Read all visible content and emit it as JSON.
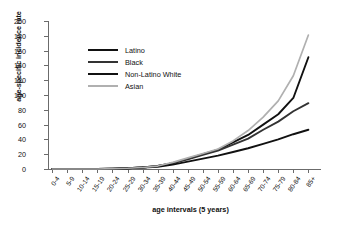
{
  "chart_data": {
    "type": "line",
    "title": "",
    "xlabel": "age intervals (5 years)",
    "ylabel": "age-specific incidence rate",
    "categories": [
      "0-4",
      "5-9",
      "10-14",
      "15-19",
      "20-24",
      "25-29",
      "30-34",
      "35-39",
      "40-44",
      "45-49",
      "50-54",
      "55-59",
      "60-64",
      "65-69",
      "70-74",
      "75-79",
      "80-84",
      "85+"
    ],
    "ylim": [
      0,
      200
    ],
    "yticks": [
      0,
      20,
      40,
      60,
      80,
      100,
      120,
      140,
      160,
      180,
      200
    ],
    "grid": false,
    "legend_position": "upper-left-inside",
    "series": [
      {
        "name": "Latino",
        "color": "#111111",
        "width": 1.9,
        "values": [
          0,
          0,
          0,
          0,
          0.5,
          1,
          2,
          4,
          8,
          14,
          20,
          26,
          36,
          46,
          60,
          74,
          96,
          151
        ]
      },
      {
        "name": "Black",
        "color": "#333333",
        "width": 1.9,
        "values": [
          0,
          0,
          0,
          0,
          0.5,
          1,
          2,
          4,
          8,
          13,
          19,
          25,
          33,
          41,
          53,
          64,
          78,
          89
        ]
      },
      {
        "name": "Non-Latino White",
        "color": "#111111",
        "width": 1.9,
        "values": [
          0,
          0,
          0,
          0,
          0.5,
          1,
          2,
          3,
          6,
          10,
          14,
          18,
          23,
          28,
          34,
          40,
          47,
          53
        ]
      },
      {
        "name": "Asian",
        "color": "#b0b0b0",
        "width": 1.7,
        "values": [
          0,
          0,
          0,
          0,
          0.5,
          1,
          2,
          4,
          9,
          15,
          21,
          27,
          38,
          52,
          70,
          92,
          126,
          181
        ]
      }
    ]
  },
  "legend": {
    "items": [
      {
        "label": "Latino"
      },
      {
        "label": "Black"
      },
      {
        "label": "Non-Latino White"
      },
      {
        "label": "Asian"
      }
    ]
  }
}
